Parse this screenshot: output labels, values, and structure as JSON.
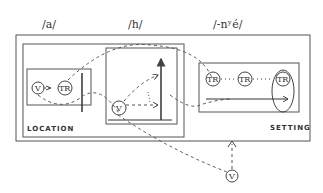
{
  "header_labels": {
    "left": "/a/",
    "middle": "/h/",
    "right": "/-nʸé/"
  },
  "captions": {
    "location": "LOCATION",
    "setting": "SETTING"
  },
  "nodes": {
    "v_label": "V",
    "tr_label": "TR"
  },
  "colors": {
    "line": "#444444",
    "background": "#ffffff"
  }
}
